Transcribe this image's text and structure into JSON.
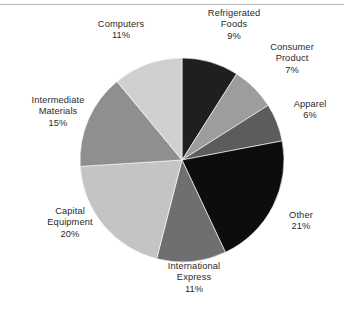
{
  "figure": {
    "background_color": "#ffffff",
    "rule_color": "#b9b9b9",
    "text_color": "#2a2a2a"
  },
  "chart_data": {
    "type": "pie",
    "title": "",
    "subtitle": "",
    "xlabel": "",
    "ylabel": "",
    "legend_position": "none",
    "grid": false,
    "labels_outside": true,
    "start_angle_deg": 0,
    "direction": "clockwise",
    "center": {
      "x": 182,
      "y": 160
    },
    "radius": 102,
    "units": "percent",
    "total": 100,
    "categories": [
      "Refrigerated Foods",
      "Consumer Product",
      "Apparel",
      "Other",
      "International Express",
      "Capital Equipment",
      "Intermediate Materials",
      "Computers"
    ],
    "values": [
      9,
      7,
      6,
      21,
      11,
      20,
      15,
      11
    ],
    "colors": [
      "#1f1f1f",
      "#9d9d9d",
      "#5c5c5c",
      "#0d0d0d",
      "#6f6f6f",
      "#c4c4c4",
      "#8f8f8f",
      "#d0d0d0"
    ],
    "slices": [
      {
        "id": "refrigerated-foods",
        "label": "Refrigerated\nFoods",
        "name_line1": "Refrigerated",
        "name_line2": "Foods",
        "value": 9,
        "percent_text": "9%",
        "color": "#1f1f1f"
      },
      {
        "id": "consumer-product",
        "label": "Consumer\nProduct",
        "name_line1": "Consumer",
        "name_line2": "Product",
        "value": 7,
        "percent_text": "7%",
        "color": "#9d9d9d"
      },
      {
        "id": "apparel",
        "label": "Apparel",
        "name_line1": "Apparel",
        "name_line2": "",
        "value": 6,
        "percent_text": "6%",
        "color": "#5c5c5c"
      },
      {
        "id": "other",
        "label": "Other",
        "name_line1": "Other",
        "name_line2": "",
        "value": 21,
        "percent_text": "21%",
        "color": "#0d0d0d"
      },
      {
        "id": "international-express",
        "label": "International\nExpress",
        "name_line1": "International",
        "name_line2": "Express",
        "value": 11,
        "percent_text": "11%",
        "color": "#6f6f6f"
      },
      {
        "id": "capital-equipment",
        "label": "Capital\nEquipment",
        "name_line1": "Capital",
        "name_line2": "Equipment",
        "value": 20,
        "percent_text": "20%",
        "color": "#c4c4c4"
      },
      {
        "id": "intermediate-materials",
        "label": "Intermediate\nMaterials",
        "name_line1": "Intermediate",
        "name_line2": "Materials",
        "value": 15,
        "percent_text": "15%",
        "color": "#8f8f8f"
      },
      {
        "id": "computers",
        "label": "Computers",
        "name_line1": "Computers",
        "name_line2": "",
        "value": 11,
        "percent_text": "11%",
        "color": "#d0d0d0"
      }
    ]
  }
}
